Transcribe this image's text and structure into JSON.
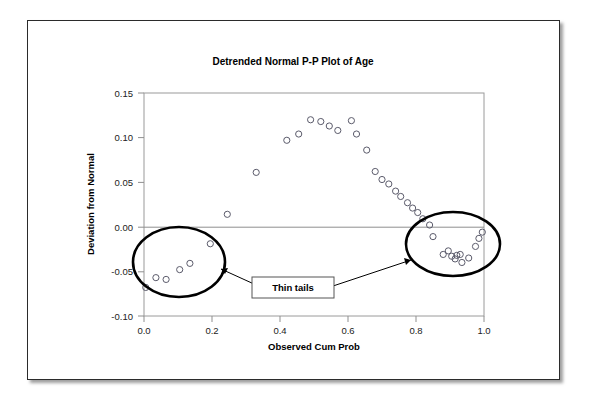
{
  "chart_data": {
    "type": "scatter",
    "title": "Detrended Normal P-P Plot of Age",
    "xlabel": "Observed Cum Prob",
    "ylabel": "Deviation from Normal",
    "xlim": [
      0.0,
      1.0
    ],
    "ylim": [
      -0.1,
      0.15
    ],
    "xticks": [
      "0.0",
      "0.2",
      "0.4",
      "0.6",
      "0.8",
      "1.0"
    ],
    "xtick_values": [
      0.0,
      0.2,
      0.4,
      0.6,
      0.8,
      1.0
    ],
    "yticks": [
      "0.15",
      "0.10",
      "0.05",
      "0.00",
      "-0.05",
      "-0.10"
    ],
    "ytick_values": [
      0.15,
      0.1,
      0.05,
      0.0,
      -0.05,
      -0.1
    ],
    "grid": false,
    "legend": "none",
    "reference_line_y": 0.0,
    "marker": "open-circle",
    "points": [
      [
        0.005,
        -0.068
      ],
      [
        0.035,
        -0.057
      ],
      [
        0.065,
        -0.059
      ],
      [
        0.105,
        -0.048
      ],
      [
        0.135,
        -0.041
      ],
      [
        0.195,
        -0.019
      ],
      [
        0.245,
        0.014
      ],
      [
        0.33,
        0.061
      ],
      [
        0.42,
        0.097
      ],
      [
        0.455,
        0.104
      ],
      [
        0.49,
        0.12
      ],
      [
        0.52,
        0.118
      ],
      [
        0.545,
        0.113
      ],
      [
        0.57,
        0.108
      ],
      [
        0.61,
        0.119
      ],
      [
        0.625,
        0.104
      ],
      [
        0.655,
        0.086
      ],
      [
        0.68,
        0.062
      ],
      [
        0.7,
        0.053
      ],
      [
        0.72,
        0.048
      ],
      [
        0.74,
        0.04
      ],
      [
        0.755,
        0.034
      ],
      [
        0.775,
        0.027
      ],
      [
        0.79,
        0.021
      ],
      [
        0.805,
        0.016
      ],
      [
        0.82,
        0.009
      ],
      [
        0.84,
        0.002
      ],
      [
        0.85,
        -0.011
      ],
      [
        0.88,
        -0.031
      ],
      [
        0.895,
        -0.027
      ],
      [
        0.905,
        -0.033
      ],
      [
        0.915,
        -0.036
      ],
      [
        0.92,
        -0.032
      ],
      [
        0.93,
        -0.031
      ],
      [
        0.935,
        -0.04
      ],
      [
        0.955,
        -0.035
      ],
      [
        0.975,
        -0.022
      ],
      [
        0.985,
        -0.013
      ],
      [
        0.995,
        -0.006
      ]
    ],
    "annotations": [
      {
        "label": "Thin tails",
        "kind": "callout-box",
        "targets": [
          "left-tail-cluster",
          "right-tail-cluster"
        ]
      },
      {
        "kind": "ellipse",
        "name": "left-tail-cluster",
        "x_range": [
          0.0,
          0.26
        ],
        "y_range": [
          -0.085,
          -0.012
        ]
      },
      {
        "kind": "ellipse",
        "name": "right-tail-cluster",
        "x_range": [
          0.8,
          1.02
        ],
        "y_range": [
          -0.055,
          0.012
        ]
      }
    ]
  },
  "colors": {
    "marker_stroke": "#5b5b6b",
    "axis": "#8f8f8f",
    "annotation": "#000000",
    "frame": "#2b2b2b",
    "background": "#ffffff"
  }
}
